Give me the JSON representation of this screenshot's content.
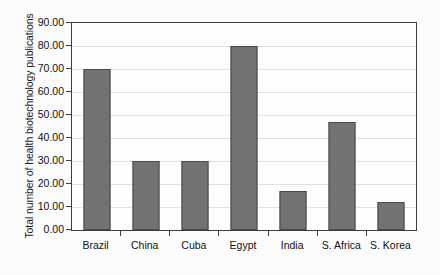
{
  "chart_data": {
    "type": "bar",
    "title": "",
    "xlabel": "",
    "ylabel": "Total number of health biotechnology publications",
    "categories": [
      "Brazil",
      "China",
      "Cuba",
      "Egypt",
      "India",
      "S. Africa",
      "S. Korea"
    ],
    "values": [
      70,
      30,
      30,
      80,
      17,
      47,
      12
    ],
    "ylim": [
      0,
      90
    ],
    "ytick_step": 10,
    "ytick_labels": [
      "0.00",
      "10.00",
      "20.00",
      "30.00",
      "40.00",
      "50.00",
      "60.00",
      "70.00",
      "80.00",
      "90.00"
    ],
    "ytick_values": [
      0,
      10,
      20,
      30,
      40,
      50,
      60,
      70,
      80,
      90
    ],
    "grid": true,
    "legend": null,
    "series": [
      {
        "name": "Total number of health biotechnology publications",
        "values": [
          70,
          30,
          30,
          80,
          17,
          47,
          12
        ]
      }
    ],
    "colors": {
      "bar_fill": "#737373",
      "bar_border": "#4a4a4a",
      "gridline": "#e2e2e2",
      "axis": "#3d3d3d",
      "text": "#111111",
      "background": "#ffffff"
    }
  }
}
